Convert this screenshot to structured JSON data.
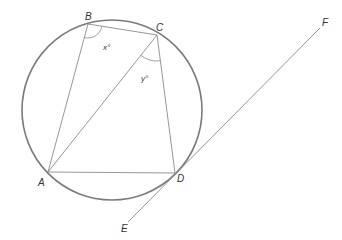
{
  "diagram": {
    "type": "circle-geometry",
    "circle": {
      "cx": 112,
      "cy": 110,
      "r": 90,
      "stroke": "#7a7a7a",
      "stroke_width": 1.6
    },
    "points": {
      "A": {
        "x": 48,
        "y": 172,
        "label": "A",
        "lx": 38,
        "ly": 186
      },
      "B": {
        "x": 88,
        "y": 24,
        "label": "B",
        "lx": 85,
        "ly": 20
      },
      "C": {
        "x": 157,
        "y": 35,
        "label": "C",
        "lx": 156,
        "ly": 31
      },
      "D": {
        "x": 175,
        "y": 173,
        "label": "D",
        "lx": 177,
        "ly": 182
      },
      "E": {
        "x": 128,
        "y": 222,
        "label": "E",
        "lx": 121,
        "ly": 232
      },
      "F": {
        "x": 320,
        "y": 28,
        "label": "F",
        "lx": 322,
        "ly": 26
      }
    },
    "segments": [
      {
        "from": "A",
        "to": "B"
      },
      {
        "from": "B",
        "to": "C"
      },
      {
        "from": "C",
        "to": "D"
      },
      {
        "from": "A",
        "to": "D"
      },
      {
        "from": "A",
        "to": "C"
      },
      {
        "from": "E",
        "to": "F"
      }
    ],
    "line_color": "#8a8a8a",
    "angles": [
      {
        "vertex": "B",
        "label": "x°",
        "lx": 103,
        "ly": 50
      },
      {
        "vertex": "C",
        "label": "y°",
        "lx": 141,
        "ly": 81
      }
    ],
    "tangent_line": {
      "label": "EF",
      "touches": "D"
    }
  }
}
